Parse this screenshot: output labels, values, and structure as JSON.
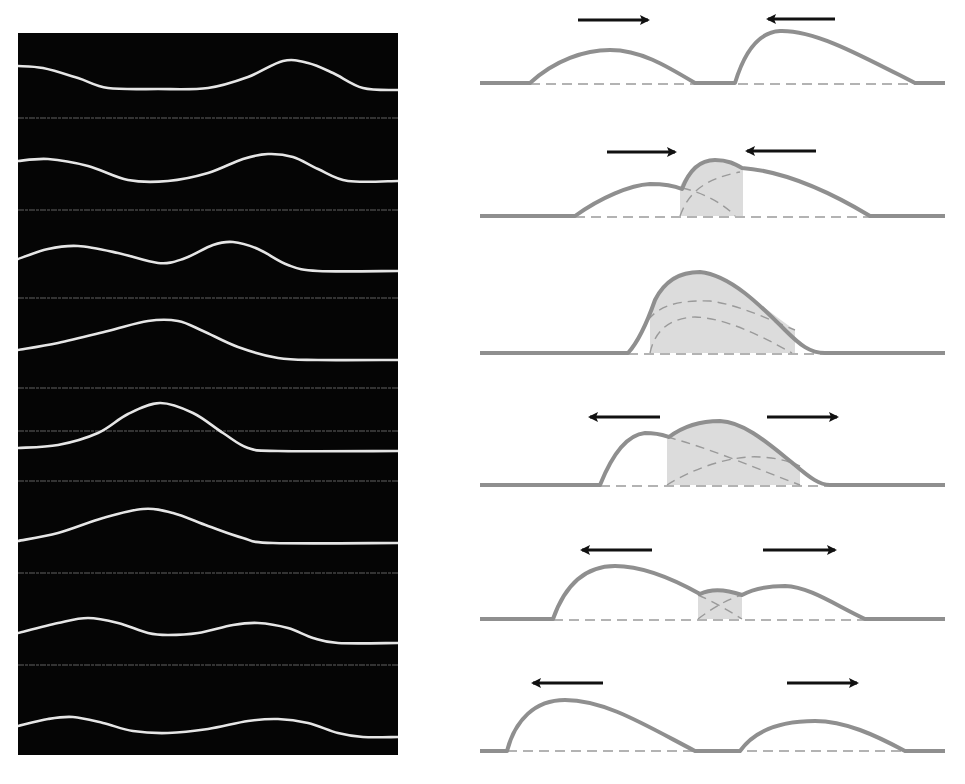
{
  "figure": {
    "photo_panel": {
      "background": "#050505",
      "string_color": "#e6e6e6",
      "reference_line_color": "#7a7a7a",
      "reference_lines_y": [
        85,
        177,
        265,
        355,
        398,
        448,
        540,
        632
      ],
      "frames": [
        {
          "label": "frame-1",
          "points": [
            [
              0,
              33
            ],
            [
              25,
              35
            ],
            [
              60,
              45
            ],
            [
              90,
              55
            ],
            [
              140,
              56
            ],
            [
              190,
              55
            ],
            [
              230,
              44
            ],
            [
              265,
              28
            ],
            [
              290,
              30
            ],
            [
              315,
              40
            ],
            [
              345,
              55
            ],
            [
              380,
              57
            ]
          ]
        },
        {
          "label": "frame-2",
          "points": [
            [
              0,
              128
            ],
            [
              30,
              126
            ],
            [
              70,
              133
            ],
            [
              110,
              147
            ],
            [
              150,
              148
            ],
            [
              190,
              140
            ],
            [
              225,
              126
            ],
            [
              250,
              121
            ],
            [
              275,
              124
            ],
            [
              300,
              136
            ],
            [
              330,
              148
            ],
            [
              380,
              148
            ]
          ]
        },
        {
          "label": "frame-3",
          "points": [
            [
              0,
              226
            ],
            [
              30,
              216
            ],
            [
              60,
              213
            ],
            [
              100,
              220
            ],
            [
              140,
              230
            ],
            [
              165,
              226
            ],
            [
              195,
              212
            ],
            [
              215,
              209
            ],
            [
              240,
              216
            ],
            [
              270,
              232
            ],
            [
              300,
              238
            ],
            [
              380,
              238
            ]
          ]
        },
        {
          "label": "frame-4",
          "points": [
            [
              0,
              317
            ],
            [
              40,
              310
            ],
            [
              90,
              298
            ],
            [
              130,
              288
            ],
            [
              160,
              288
            ],
            [
              185,
              298
            ],
            [
              220,
              314
            ],
            [
              260,
              325
            ],
            [
              300,
              327
            ],
            [
              380,
              327
            ]
          ]
        },
        {
          "label": "frame-5",
          "points": [
            [
              0,
              415
            ],
            [
              40,
              412
            ],
            [
              80,
              400
            ],
            [
              110,
              381
            ],
            [
              142,
              370
            ],
            [
              175,
              380
            ],
            [
              205,
              400
            ],
            [
              230,
              415
            ],
            [
              260,
              418
            ],
            [
              380,
              418
            ]
          ]
        },
        {
          "label": "frame-6",
          "points": [
            [
              0,
              508
            ],
            [
              40,
              500
            ],
            [
              85,
              485
            ],
            [
              125,
              476
            ],
            [
              155,
              480
            ],
            [
              190,
              493
            ],
            [
              225,
              505
            ],
            [
              255,
              510
            ],
            [
              380,
              510
            ]
          ]
        },
        {
          "label": "frame-7",
          "points": [
            [
              0,
              600
            ],
            [
              40,
              590
            ],
            [
              70,
              585
            ],
            [
              100,
              590
            ],
            [
              130,
              600
            ],
            [
              150,
              602
            ],
            [
              180,
              600
            ],
            [
              215,
              592
            ],
            [
              240,
              590
            ],
            [
              270,
              595
            ],
            [
              295,
              605
            ],
            [
              320,
              610
            ],
            [
              380,
              610
            ]
          ]
        },
        {
          "label": "frame-8",
          "points": [
            [
              0,
              693
            ],
            [
              30,
              686
            ],
            [
              55,
              684
            ],
            [
              85,
              690
            ],
            [
              115,
              698
            ],
            [
              150,
              700
            ],
            [
              190,
              696
            ],
            [
              230,
              688
            ],
            [
              260,
              686
            ],
            [
              290,
              690
            ],
            [
              320,
              700
            ],
            [
              345,
              704
            ],
            [
              380,
              704
            ]
          ]
        }
      ]
    },
    "diagram_panel": {
      "curve_color": "#8f8f8f",
      "fill_color": "#dcdcdc",
      "dash_color": "#9a9a9a",
      "arrow_color": "#111111",
      "frames": [
        {
          "label": "approach",
          "baseline_y": 83,
          "arrows": [
            {
              "x1": 108,
              "x2": 178,
              "y": 20,
              "dir": "right"
            },
            {
              "x1": 365,
              "x2": 298,
              "y": 19,
              "dir": "left"
            }
          ],
          "fill": null,
          "dashed": [],
          "outline": "M10,83 L60,83 C85,60 115,50 140,50 C170,50 195,65 225,83 L265,83 C275,50 290,32 310,31 C345,30 390,55 445,83 L475,83",
          "baseline_dash": [
            60,
            445
          ]
        },
        {
          "label": "begin-overlap",
          "baseline_y": 216,
          "arrows": [
            {
              "x1": 137,
              "x2": 205,
              "y": 152,
              "dir": "right"
            },
            {
              "x1": 346,
              "x2": 277,
              "y": 151,
              "dir": "left"
            }
          ],
          "fill": "M210,216 L210,187 C218,168 232,160 245,160 C258,160 265,164 273,168 L273,216 Z",
          "dashed": [
            "M210,216 C218,195 230,180 270,172",
            "M212,188 C235,193 255,205 265,216"
          ],
          "outline": "M10,216 L105,216 C130,198 160,185 180,184 C195,184 205,186 212,189 C220,168 232,160 245,160 C258,160 265,164 272,168 C300,170 340,180 400,216 L475,216",
          "baseline_dash": [
            105,
            400
          ]
        },
        {
          "label": "full-overlap",
          "baseline_y": 353,
          "arrows": [],
          "fill": "M180,353 L180,320 C185,295 195,275 215,272 L240,275 C270,285 295,310 325,330 L325,353 Z",
          "dashed": [
            "M178,320 C190,305 210,300 240,301 C270,305 300,320 325,330",
            "M180,353 C185,330 200,318 225,317 C255,318 290,335 322,353"
          ],
          "outline": "M10,353 L158,353 C170,340 178,320 185,300 C195,280 210,272 230,272 C260,275 290,305 315,330 C330,345 340,353 355,353 L475,353",
          "baseline_dash": [
            158,
            355
          ]
        },
        {
          "label": "separating",
          "baseline_y": 485,
          "arrows": [
            {
              "x1": 190,
              "x2": 120,
              "y": 417,
              "dir": "left"
            },
            {
              "x1": 297,
              "x2": 367,
              "y": 417,
              "dir": "right"
            }
          ],
          "fill": "M197,485 L197,437 C215,425 235,421 250,421 C275,422 300,445 330,466 L330,485 Z",
          "dashed": [
            "M197,437 C240,448 290,470 330,485",
            "M197,485 C220,470 260,455 290,457 C310,458 320,462 330,466"
          ],
          "outline": "M10,485 L130,485 C140,460 155,435 175,433 C188,433 193,435 199,437 C215,425 235,421 250,421 C275,422 300,445 325,465 C340,478 350,485 360,485 L475,485",
          "baseline_dash": [
            130,
            360
          ]
        },
        {
          "label": "after-overlap",
          "baseline_y": 619,
          "arrows": [
            {
              "x1": 182,
              "x2": 112,
              "y": 550,
              "dir": "left"
            },
            {
              "x1": 293,
              "x2": 365,
              "y": 550,
              "dir": "right"
            }
          ],
          "fill": "M228,619 L228,595 C240,590 252,589 262,594 L272,595 L272,619 Z",
          "dashed": [
            "M228,595 C240,600 258,610 272,619",
            "M228,619 C240,610 255,600 272,595"
          ],
          "outline": "M10,619 L83,619 C95,585 115,566 145,566 C175,566 205,580 230,594 C240,589 255,589 272,595 C285,588 300,586 315,586 C340,587 365,605 395,619 L475,619",
          "baseline_dash": [
            83,
            395
          ]
        },
        {
          "label": "separated",
          "baseline_y": 750,
          "arrows": [
            {
              "x1": 133,
              "x2": 63,
              "y": 683,
              "dir": "left"
            },
            {
              "x1": 317,
              "x2": 387,
              "y": 683,
              "dir": "right"
            }
          ],
          "fill": null,
          "dashed": [],
          "outline": "M10,751 L37,751 C45,720 65,700 95,700 C135,700 175,725 225,751 L270,751 C285,730 310,721 345,721 C375,721 405,735 435,751 L475,751",
          "baseline_dash": [
            37,
            435
          ]
        }
      ]
    }
  }
}
